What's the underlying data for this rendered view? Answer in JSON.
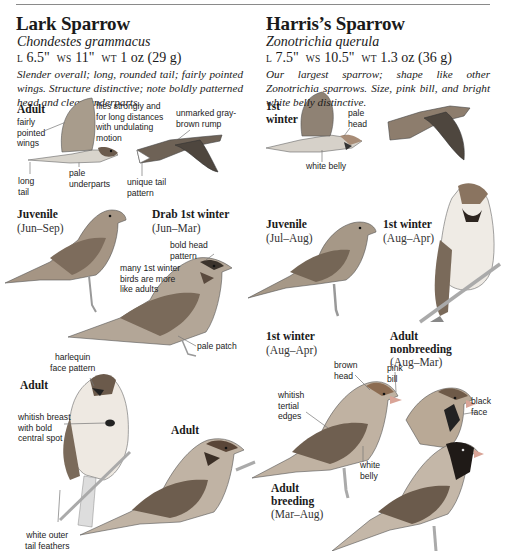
{
  "page": {
    "rule": true
  },
  "lark": {
    "title": "Lark Sparrow",
    "scientific": "Chondestes grammacus",
    "measurements": {
      "l_label": "L",
      "l": "6.5\"",
      "ws_label": "WS",
      "ws": "11\"",
      "wt_label": "WT",
      "wt": "1 oz (29 g)"
    },
    "description": "Slender overall; long, rounded tail; fairly pointed wings. Structure distinctive; note boldly patterned head and clean underparts.",
    "figures": {
      "adult_flight": {
        "label": "Adult"
      },
      "juvenile": {
        "label": "Juvenile",
        "dates": "(Jun–Sep)"
      },
      "drab_first_winter": {
        "label": "Drab 1st winter",
        "dates": "(Jun–Mar)"
      },
      "adult_perched_front": {
        "label": "Adult"
      },
      "adult_perched_side": {
        "label": "Adult"
      }
    },
    "notes": {
      "fairly_pointed_wings": [
        "fairly",
        "pointed",
        "wings"
      ],
      "flies_strongly": [
        "flies strongly and",
        "for long distances",
        "with undulating",
        "motion"
      ],
      "unmarked_rump": [
        "unmarked gray-",
        "brown rump"
      ],
      "long_tail": [
        "long",
        "tail"
      ],
      "pale_underparts": [
        "pale",
        "underparts"
      ],
      "unique_tail": [
        "unique tail",
        "pattern"
      ],
      "bold_head": [
        "bold head",
        "pattern"
      ],
      "many_first_winter": [
        "many 1st winter",
        "birds are more",
        "like adults"
      ],
      "pale_patch": [
        "pale patch"
      ],
      "harlequin": [
        "harlequin",
        "face pattern"
      ],
      "whitish_breast": [
        "whitish breast",
        "with bold",
        "central spot"
      ],
      "white_outer_tail": [
        "white outer",
        "tail feathers"
      ]
    }
  },
  "harris": {
    "title": "Harris’s Sparrow",
    "scientific": "Zonotrichia querula",
    "measurements": {
      "l_label": "L",
      "l": "7.5\"",
      "ws_label": "WS",
      "ws": "10.5\"",
      "wt_label": "WT",
      "wt": "1.3 oz (36 g)"
    },
    "description": "Our largest sparrow; shape like other Zonotrichia sparrows. Size, pink bill, and bright white belly distinctive.",
    "figures": {
      "first_winter_flight": {
        "label": [
          "1st",
          "winter"
        ]
      },
      "juvenile": {
        "label": "Juvenile",
        "dates": "(Jul–Aug)"
      },
      "first_winter_front": {
        "label": "1st winter",
        "dates": "(Aug–Apr)"
      },
      "first_winter_side": {
        "label": "1st winter",
        "dates": "(Aug–Apr)"
      },
      "adult_nonbreeding": {
        "label": [
          "Adult",
          "nonbreeding"
        ],
        "dates": "(Aug–Mar)"
      },
      "adult_breeding": {
        "label": [
          "Adult",
          "breeding"
        ],
        "dates": "(Mar–Aug)"
      }
    },
    "notes": {
      "pale_head": [
        "pale",
        "head"
      ],
      "white_belly_flight": [
        "white belly"
      ],
      "brown_head": [
        "brown",
        "head"
      ],
      "pink_bill": [
        "pink",
        "bill"
      ],
      "whitish_tertial": [
        "whitish",
        "tertial",
        "edges"
      ],
      "black_face": [
        "black",
        "face"
      ],
      "white_belly": [
        "white",
        "belly"
      ]
    }
  },
  "colors": {
    "text": "#1a1a1a",
    "rule": "#8a8a8a",
    "bird_brown": "#8a6f58",
    "bird_gray": "#9a9a9a",
    "bird_dark": "#3a3a3a",
    "bill_pink": "#d9a497"
  }
}
